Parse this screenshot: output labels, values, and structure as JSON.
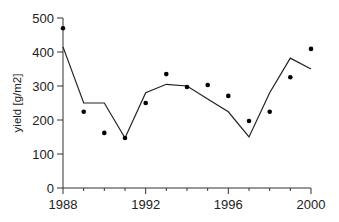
{
  "chart_data": {
    "type": "line",
    "title": "",
    "xlabel": "",
    "ylabel": "yield [g/m2]",
    "xlim": [
      1988,
      2000
    ],
    "ylim": [
      0,
      500
    ],
    "grid": false,
    "legend": null,
    "x_ticks": [
      1988,
      1992,
      1996,
      2000
    ],
    "x_minor_ticks": [
      1989,
      1990,
      1991,
      1993,
      1994,
      1995,
      1997,
      1998,
      1999
    ],
    "y_ticks": [
      0,
      100,
      200,
      300,
      400,
      500
    ],
    "x": [
      1988,
      1989,
      1990,
      1991,
      1992,
      1993,
      1994,
      1995,
      1996,
      1997,
      1998,
      1999,
      2000
    ],
    "series": [
      {
        "name": "observed",
        "style": "scatter",
        "color": "#000000",
        "values": [
          470,
          224,
          162,
          147,
          250,
          335,
          297,
          303,
          271,
          197,
          224,
          326,
          409
        ]
      },
      {
        "name": "simulated",
        "style": "line",
        "color": "#222222",
        "values": [
          415,
          250,
          250,
          147,
          280,
          305,
          300,
          262,
          224,
          150,
          280,
          382,
          350
        ]
      }
    ]
  }
}
